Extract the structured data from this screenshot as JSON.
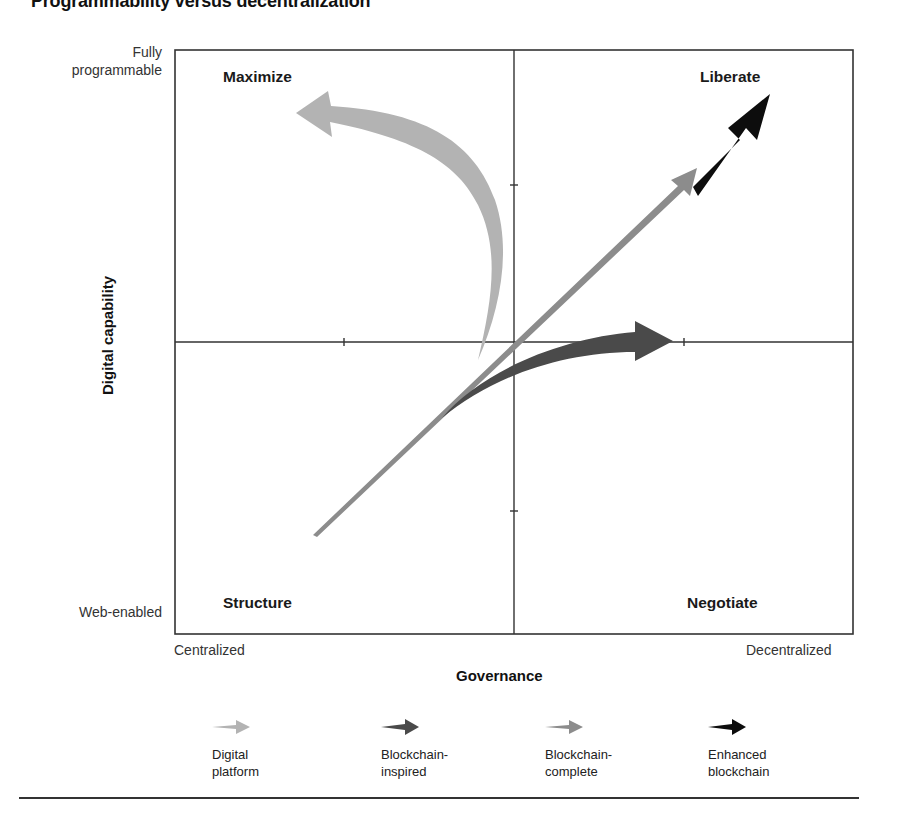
{
  "title": "Programmability versus decentralization",
  "axes": {
    "y_title": "Digital capability",
    "y_top_label": "Fully\nprogrammable",
    "y_bottom_label": "Web-enabled",
    "x_title": "Governance",
    "x_left_label": "Centralized",
    "x_right_label": "Decentralized"
  },
  "quadrants": {
    "top_left": "Maximize",
    "top_right": "Liberate",
    "bottom_left": "Structure",
    "bottom_right": "Negotiate"
  },
  "legend": [
    {
      "label": "Digital\nplatform",
      "color": "#b3b3b3",
      "icon": "arrow-right-icon"
    },
    {
      "label": "Blockchain-\ninspired",
      "color": "#4a4a4a",
      "icon": "arrow-right-icon"
    },
    {
      "label": "Blockchain-\ncomplete",
      "color": "#8c8c8c",
      "icon": "arrow-right-icon"
    },
    {
      "label": "Enhanced\nblockchain",
      "color": "#0d0d0d",
      "icon": "arrow-right-icon"
    }
  ],
  "colors": {
    "digital_platform": "#b3b3b3",
    "blockchain_inspired": "#4a4a4a",
    "blockchain_complete": "#8c8c8c",
    "enhanced_blockchain": "#0d0d0d",
    "frame": "#333333"
  }
}
